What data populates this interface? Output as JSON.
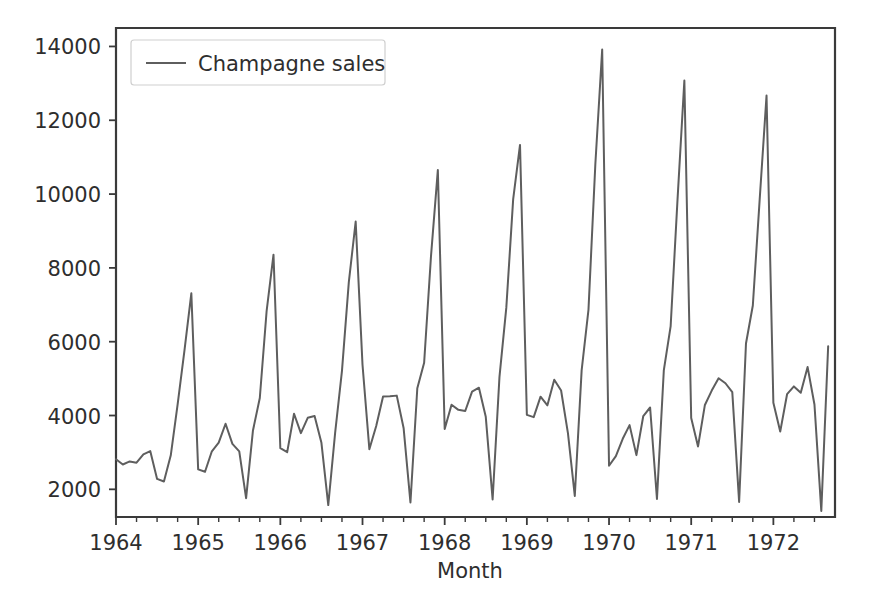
{
  "chart_data": {
    "type": "line",
    "title": "",
    "xlabel": "Month",
    "ylabel": "",
    "xlim": [
      1964.0,
      1972.75
    ],
    "ylim": [
      1250,
      14500
    ],
    "grid": false,
    "legend_position": "upper left",
    "x_tick_labels": [
      "1964",
      "1965",
      "1966",
      "1967",
      "1968",
      "1969",
      "1970",
      "1971",
      "1972"
    ],
    "x_tick_values": [
      1964,
      1965,
      1966,
      1967,
      1968,
      1969,
      1970,
      1971,
      1972
    ],
    "x_minor_ticks_per_interval": 3,
    "y_tick_labels": [
      "2000",
      "4000",
      "6000",
      "8000",
      "10000",
      "12000",
      "14000"
    ],
    "y_tick_values": [
      2000,
      4000,
      6000,
      8000,
      10000,
      12000,
      14000
    ],
    "line_color": "#5e5e5e",
    "series": [
      {
        "name": "Champagne sales",
        "x": [
          1964.0,
          1964.0833,
          1964.1667,
          1964.25,
          1964.3333,
          1964.4167,
          1964.5,
          1964.5833,
          1964.6667,
          1964.75,
          1964.8333,
          1964.9167,
          1965.0,
          1965.0833,
          1965.1667,
          1965.25,
          1965.3333,
          1965.4167,
          1965.5,
          1965.5833,
          1965.6667,
          1965.75,
          1965.8333,
          1965.9167,
          1966.0,
          1966.0833,
          1966.1667,
          1966.25,
          1966.3333,
          1966.4167,
          1966.5,
          1966.5833,
          1966.6667,
          1966.75,
          1966.8333,
          1966.9167,
          1967.0,
          1967.0833,
          1967.1667,
          1967.25,
          1967.3333,
          1967.4167,
          1967.5,
          1967.5833,
          1967.6667,
          1967.75,
          1967.8333,
          1967.9167,
          1968.0,
          1968.0833,
          1968.1667,
          1968.25,
          1968.3333,
          1968.4167,
          1968.5,
          1968.5833,
          1968.6667,
          1968.75,
          1968.8333,
          1968.9167,
          1969.0,
          1969.0833,
          1969.1667,
          1969.25,
          1969.3333,
          1969.4167,
          1969.5,
          1969.5833,
          1969.6667,
          1969.75,
          1969.8333,
          1969.9167,
          1970.0,
          1970.0833,
          1970.1667,
          1970.25,
          1970.3333,
          1970.4167,
          1970.5,
          1970.5833,
          1970.6667,
          1970.75,
          1970.8333,
          1970.9167,
          1971.0,
          1971.0833,
          1971.1667,
          1971.25,
          1971.3333,
          1971.4167,
          1971.5,
          1971.5833,
          1971.6667,
          1971.75,
          1971.8333,
          1971.9167,
          1972.0,
          1972.0833,
          1972.1667,
          1972.25,
          1972.3333,
          1972.4167,
          1972.5,
          1972.5833,
          1972.6667
        ],
        "values": [
          2815,
          2672,
          2755,
          2721,
          2946,
          3036,
          2282,
          2212,
          2922,
          4301,
          5764,
          7312,
          2541,
          2475,
          3031,
          3266,
          3776,
          3230,
          3028,
          1759,
          3595,
          4474,
          6838,
          8357,
          3113,
          3006,
          4047,
          3523,
          3937,
          3986,
          3260,
          1573,
          3528,
          5211,
          7614,
          9254,
          5375,
          3088,
          3718,
          4514,
          4520,
          4539,
          3663,
          1643,
          4739,
          5428,
          8314,
          10651,
          3633,
          4292,
          4154,
          4121,
          4647,
          4753,
          3965,
          1723,
          5048,
          6922,
          9858,
          11331,
          4016,
          3957,
          4510,
          4276,
          4968,
          4677,
          3523,
          1821,
          5222,
          6872,
          10803,
          13916,
          2639,
          2899,
          3370,
          3740,
          2927,
          3986,
          4217,
          1738,
          5221,
          6424,
          9842,
          13076,
          3934,
          3162,
          4286,
          4676,
          5010,
          4874,
          4633,
          1659,
          5951,
          6981,
          9851,
          12670,
          4348,
          3564,
          4577,
          4788,
          4618,
          5312,
          4298,
          1413,
          5877
        ]
      }
    ],
    "legend_entries": [
      {
        "label": "Champagne sales",
        "color": "#5e5e5e",
        "marker": "line"
      }
    ],
    "peaks": [
      {
        "x": 1964.9167,
        "y": 7312,
        "note": "Dec 1964"
      },
      {
        "x": 1965.9167,
        "y": 8357,
        "note": "Dec 1965"
      },
      {
        "x": 1966.9167,
        "y": 9254,
        "note": "Dec 1966"
      },
      {
        "x": 1967.9167,
        "y": 10651,
        "note": "Dec 1967"
      },
      {
        "x": 1968.9167,
        "y": 11331,
        "note": "Dec 1968"
      },
      {
        "x": 1969.9167,
        "y": 13916,
        "note": "Dec 1969"
      },
      {
        "x": 1970.9167,
        "y": 13076,
        "note": "Dec 1970"
      },
      {
        "x": 1971.9167,
        "y": 12670,
        "note": "Dec 1971"
      }
    ],
    "troughs": [
      {
        "x": 1965.5833,
        "y": 1759,
        "note": "Aug 1965"
      },
      {
        "x": 1966.5833,
        "y": 1573,
        "note": "Aug 1966"
      },
      {
        "x": 1967.5833,
        "y": 1643,
        "note": "Aug 1967"
      },
      {
        "x": 1968.5833,
        "y": 1723,
        "note": "Aug 1968"
      },
      {
        "x": 1969.5833,
        "y": 1821,
        "note": "Aug 1969"
      },
      {
        "x": 1970.5833,
        "y": 1738,
        "note": "Aug 1970"
      },
      {
        "x": 1971.5833,
        "y": 1659,
        "note": "Aug 1971"
      },
      {
        "x": 1972.5833,
        "y": 1413,
        "note": "Aug 1972"
      }
    ]
  },
  "figure": {
    "background_color": "#ffffff",
    "axes_color": "#3a3a3a"
  }
}
